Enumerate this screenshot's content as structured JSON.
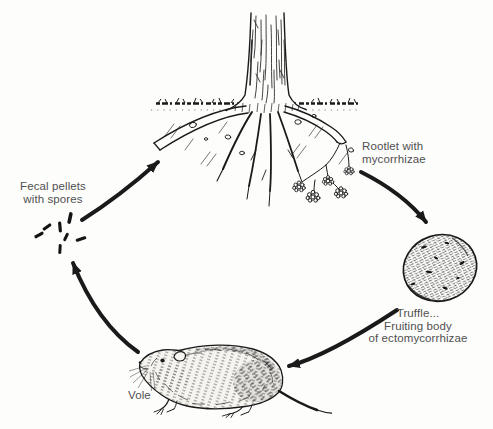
{
  "figure": {
    "background": "#fdfdfc",
    "ink_color": "#1a1a1a",
    "label_color": "#505050",
    "labels": {
      "rootlet_line1": "Rootlet with",
      "rootlet_line2": "mycorrhizae",
      "truffle_line1": "Truffle...",
      "truffle_line2": "Fruiting body",
      "truffle_line3": "of ectomycorrhizae",
      "vole": "Vole",
      "fecal_line1": "Fecal pellets",
      "fecal_line2": "with spores"
    },
    "arrows": [
      {
        "from": "fecal-pellets",
        "to": "tree-roots"
      },
      {
        "from": "rootlet-with-mycorrhizae",
        "to": "truffle"
      },
      {
        "from": "truffle",
        "to": "vole"
      },
      {
        "from": "vole",
        "to": "fecal-pellets"
      }
    ]
  }
}
